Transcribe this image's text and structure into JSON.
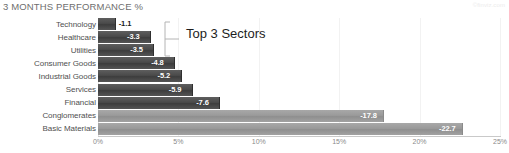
{
  "chart_data": {
    "type": "bar",
    "orientation": "horizontal",
    "title": "3 MONTHS PERFORMANCE %",
    "xlabel": "",
    "ylabel": "",
    "xlim": [
      0,
      25
    ],
    "grid": true,
    "legend": null,
    "categories": [
      "Technology",
      "Healthcare",
      "Utilities",
      "Consumer Goods",
      "Industrial Goods",
      "Services",
      "Financial",
      "Conglomerates",
      "Basic Materials"
    ],
    "values": [
      -1.1,
      -3.3,
      -3.5,
      -4.8,
      -5.2,
      -5.9,
      -7.6,
      -17.8,
      -22.7
    ],
    "bar_labels": [
      "-1.1",
      "-3.3",
      "-3.5",
      "-4.8",
      "-5.2",
      "-5.9",
      "-7.6",
      "-17.8",
      "-22.7"
    ],
    "tick_labels": [
      "0%",
      "5%",
      "10%",
      "15%",
      "20%",
      "25%"
    ],
    "tick_values": [
      0,
      5,
      10,
      15,
      20,
      25
    ],
    "annotations": [
      {
        "text": "Top 3 Sectors",
        "covers": [
          "Technology",
          "Healthcare",
          "Utilities"
        ]
      }
    ]
  },
  "watermark": {
    "text": "©finviz.com"
  },
  "colors": {
    "bar_dark": "#4a4a4a",
    "bar_light": "#9a9a9a",
    "title": "#6e6e6e",
    "label": "#4f4f4f",
    "tick": "#8a8a8a",
    "grid": "#f2f2f2",
    "annotation": "#1d1d1d",
    "background": "#ffffff"
  }
}
